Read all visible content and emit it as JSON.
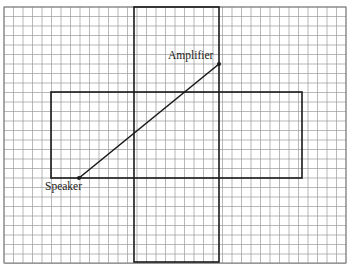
{
  "diagram": {
    "grid": {
      "x0": 4,
      "y0": 7,
      "x1": 346,
      "y1": 263,
      "pitch": 9.5,
      "line_color": "#9a9a9a"
    },
    "shapes": [
      {
        "name": "vertical-rectangle",
        "x": 134,
        "y": 7,
        "w": 85,
        "h": 255
      },
      {
        "name": "horizontal-rectangle",
        "x": 51,
        "y": 92,
        "w": 251,
        "h": 86
      }
    ],
    "segment": {
      "from": [
        79,
        178
      ],
      "to": [
        219,
        64
      ]
    },
    "points": [
      {
        "label": "Amplifier",
        "x": 219,
        "y": 64,
        "label_x": 168,
        "label_y": 49
      },
      {
        "label": "Speaker",
        "x": 79,
        "y": 178,
        "label_x": 45,
        "label_y": 180
      }
    ]
  }
}
